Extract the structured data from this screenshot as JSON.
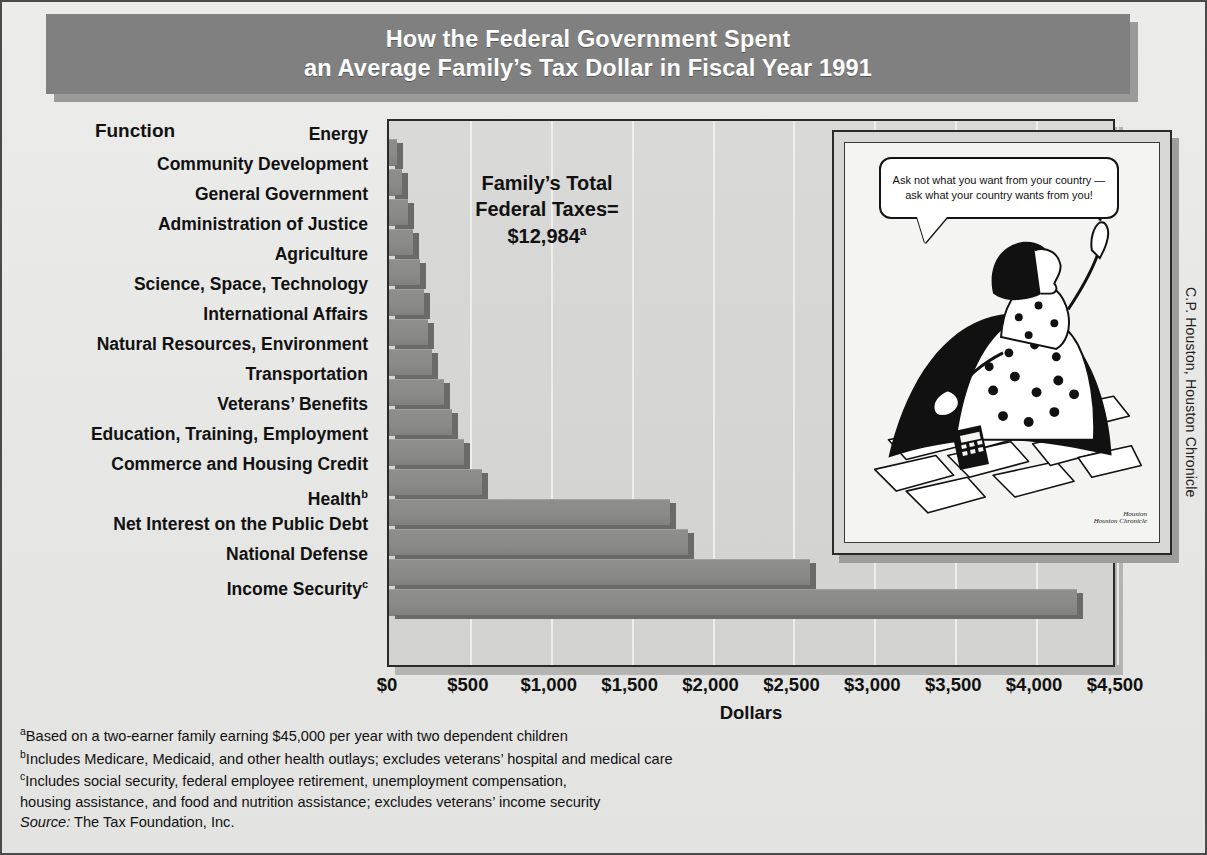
{
  "title": {
    "line1": "How the Federal Government Spent",
    "line2": "an Average Family’s Tax Dollar in Fiscal Year 1991"
  },
  "axis_header": "Function",
  "annotation": {
    "line1": "Family’s Total",
    "line2": "Federal Taxes=",
    "value": "$12,984",
    "footnote_marker": "a"
  },
  "cartoon": {
    "bubble_line1": "Ask not what you want from your country —",
    "bubble_line2": "ask what your country wants from you!",
    "signature": "Houston",
    "signature_sub": "Houston Chronicle"
  },
  "credit": "C.P. Houston, Houston Chronicle",
  "footnotes": [
    {
      "marker": "a",
      "text": "Based on a two-earner family earning $45,000 per year with two dependent children"
    },
    {
      "marker": "b",
      "text": "Includes Medicare, Medicaid, and other health outlays; excludes veterans’ hospital and medical care"
    },
    {
      "marker": "c",
      "text": "Includes social security, federal employee retirement, unemployment compensation,"
    },
    {
      "marker": "",
      "text": " housing assistance, and food and nutrition assistance; excludes veterans’ income security"
    }
  ],
  "source_label": "Source:",
  "source_text": " The Tax Foundation, Inc.",
  "colors": {
    "banner": "#808080",
    "banner_text": "#ffffff",
    "bar_fill": "#8a8a88",
    "bar_shadow": "#6a6a68",
    "plot_bg": "#d5d5d3",
    "page_bg": "#e8e8e6",
    "ink": "#111111"
  },
  "chart_data": {
    "type": "bar",
    "orientation": "horizontal",
    "title": "How the Federal Government Spent an Average Family’s Tax Dollar in Fiscal Year 1991",
    "xlabel": "Dollars",
    "ylabel": "Function",
    "xlim": [
      0,
      4500
    ],
    "xticks": [
      0,
      500,
      1000,
      1500,
      2000,
      2500,
      3000,
      3500,
      4000,
      4500
    ],
    "xtick_labels": [
      "$0",
      "$500",
      "$1,000",
      "$1,500",
      "$2,000",
      "$2,500",
      "$3,000",
      "$3,500",
      "$4,000",
      "$4,500"
    ],
    "grid": "vertical",
    "legend": "none",
    "units": "dollars per average family",
    "total": 12984,
    "categories": [
      "Energy",
      "Community Development",
      "General Government",
      "Administration of Justice",
      "Agriculture",
      "Science, Space, Technology",
      "International Affairs",
      "Natural Resources, Environment",
      "Transportation",
      "Veterans’ Benefits",
      "Education, Training, Employment",
      "Commerce and Housing Credit",
      "Health",
      "Net Interest on the Public Debt",
      "National Defense",
      "Income Security"
    ],
    "category_footnotes": [
      "",
      "",
      "",
      "",
      "",
      "",
      "",
      "",
      "",
      "",
      "",
      "",
      "b",
      "",
      "",
      "c"
    ],
    "values": [
      50,
      80,
      115,
      150,
      190,
      215,
      240,
      265,
      340,
      390,
      465,
      575,
      1735,
      1850,
      2600,
      4250
    ]
  }
}
